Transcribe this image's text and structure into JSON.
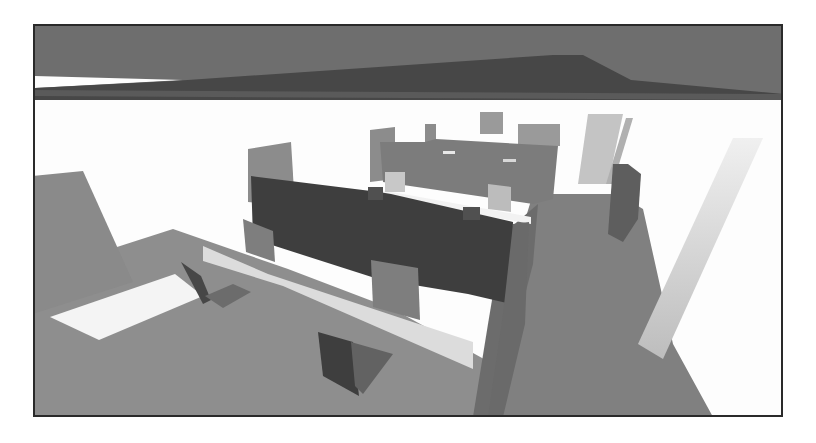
{
  "scene": {
    "description": "Grayscale 3D render of an office interior with cubicle partitions, desks and chairs, viewed from above at an angle",
    "frame": {
      "x": 33,
      "y": 24,
      "width": 750,
      "height": 393,
      "border_color": "#2a2a2a"
    },
    "colors": {
      "ceiling": "#6e6e6e",
      "ceiling_beam": "#4a4a4a",
      "wall": "#fdfdfd",
      "floor": "#8c8c8c",
      "floor_light": "#e6e6e6",
      "partition_dark": "#3e3e3e",
      "partition_mid": "#7a7a7a",
      "partition_light": "#9a9a9a",
      "panel_light": "#b4b4b4",
      "corridor": "#7e7e7e",
      "chair_dark": "#444444",
      "chair_mid": "#6a6a6a"
    },
    "shapes": [
      {
        "name": "ceiling",
        "fill": "#6e6e6e",
        "points": "0,0 750,0 750,76 0,76"
      },
      {
        "name": "ceiling-gap-white",
        "fill": "#fdfdfd",
        "points": "0,52 150,56 0,64"
      },
      {
        "name": "ceiling-beam",
        "fill": "#474747",
        "points": "0,64 140,57 520,31 550,31 598,56 750,70 750,76 0,76"
      },
      {
        "name": "ceiling-beam-edge",
        "fill": "#5a5a5a",
        "points": "0,66 750,70 750,76 0,72"
      },
      {
        "name": "wall",
        "fill": "#fdfdfd",
        "points": "0,76 750,76 750,393 0,393"
      },
      {
        "name": "floor-left",
        "fill": "#8e8e8e",
        "points": "0,250 140,205 255,245 360,285 460,340 440,393 0,393"
      },
      {
        "name": "floor-light-strip",
        "fill": "#f4f4f4",
        "points": "17,293 142,250 170,272 66,316"
      },
      {
        "name": "floor-light-band",
        "fill": "#dcdcdc",
        "points": "170,222 235,250 440,318 440,345 360,310 250,262 170,237"
      },
      {
        "name": "left-panel",
        "fill": "#8a8a8a",
        "points": "0,152 50,147 100,258 0,290"
      },
      {
        "name": "corridor-floor",
        "fill": "#808080",
        "points": "500,170 585,170 610,185 640,320 680,393 440,393 460,300"
      },
      {
        "name": "corridor-wall-left",
        "fill": "#6c6c6c",
        "points": "470,210 505,180 500,240 460,393 440,393 455,300"
      },
      {
        "name": "right-glass-panel",
        "fill": "#d2d2d2",
        "points": "700,114 730,114 630,335 605,320"
      },
      {
        "name": "back-tall-panel-1",
        "fill": "#c4c4c4",
        "points": "555,90 590,90 575,160 545,160"
      },
      {
        "name": "back-tall-panel-2",
        "fill": "#b0b0b0",
        "points": "593,94 600,94 580,160 573,160"
      },
      {
        "name": "right-cabinet",
        "fill": "#5e5e5e",
        "points": "580,140 595,140 608,150 605,195 590,218 575,210"
      },
      {
        "name": "back-partition-top-1",
        "fill": "#8c8c8c",
        "points": "337,106 362,103 362,155 337,158"
      },
      {
        "name": "back-partition-top-2",
        "fill": "#8c8c8c",
        "points": "392,100 403,100 403,118 392,118"
      },
      {
        "name": "back-partition-top-3",
        "fill": "#9a9a9a",
        "points": "447,88 470,88 470,110 447,110"
      },
      {
        "name": "back-partition-top-4",
        "fill": "#9a9a9a",
        "points": "485,100 527,100 527,122 485,122"
      },
      {
        "name": "back-partition-wall",
        "fill": "#7c7c7c",
        "points": "347,118 392,118 403,115 525,122 520,175 500,180 350,158"
      },
      {
        "name": "back-partition-slit-1",
        "fill": "#e8e8e8",
        "points": "410,127 422,127 422,130 410,130"
      },
      {
        "name": "back-partition-slit-2",
        "fill": "#d8d8d8",
        "points": "470,135 483,135 483,138 470,138"
      },
      {
        "name": "desk-top",
        "fill": "#f2f2f2",
        "points": "342,165 498,193 498,200 342,172"
      },
      {
        "name": "monitor-1",
        "fill": "#c8c8c8",
        "points": "352,148 372,148 372,168 352,168"
      },
      {
        "name": "monitor-2",
        "fill": "#bcbcbc",
        "points": "455,160 478,163 478,188 455,185"
      },
      {
        "name": "left-tall-panel",
        "fill": "#8c8c8c",
        "points": "215,125 258,118 262,183 215,178"
      },
      {
        "name": "front-partition-dark",
        "fill": "#3e3e3e",
        "points": "218,152 346,168 358,170 480,198 478,280 435,270 345,255 220,215"
      },
      {
        "name": "front-partition-cap-1",
        "fill": "#505050",
        "points": "335,163 350,163 350,176 335,176"
      },
      {
        "name": "front-partition-cap-2",
        "fill": "#505050",
        "points": "430,183 447,183 447,196 430,196"
      },
      {
        "name": "partition-end-panel",
        "fill": "#6a6a6a",
        "points": "480,200 496,198 492,300 470,393 455,393 470,290"
      },
      {
        "name": "small-panel-left",
        "fill": "#7e7e7e",
        "points": "210,195 240,207 242,238 213,228"
      },
      {
        "name": "small-panel-front",
        "fill": "#7e7e7e",
        "points": "338,236 385,244 387,296 340,283"
      },
      {
        "name": "chair-1-back",
        "fill": "#474747",
        "points": "148,238 168,252 178,276 170,280"
      },
      {
        "name": "chair-1-seat",
        "fill": "#6c6c6c",
        "points": "172,272 200,260 218,268 190,284"
      },
      {
        "name": "chair-2-back",
        "fill": "#3e3e3e",
        "points": "285,308 320,318 326,372 290,352"
      },
      {
        "name": "chair-2-seat",
        "fill": "#626262",
        "points": "318,318 360,330 330,370 322,362"
      }
    ]
  }
}
